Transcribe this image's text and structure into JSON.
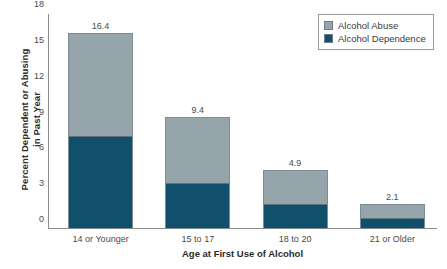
{
  "chart_data": {
    "type": "bar",
    "subtype": "stacked-bar",
    "title": "",
    "xlabel": "Age at First Use of Alcohol",
    "ylabel": "Percent Dependent or Abusing in Past Year",
    "ylabel_line1": "Percent Dependent or Abusing",
    "ylabel_line2": "in Past Year",
    "categories": [
      "14 or Younger",
      "15 to 17",
      "18 to 20",
      "21 or Older"
    ],
    "series": [
      {
        "name": "Alcohol Abuse",
        "color": "#96a4ab",
        "values": [
          8.6,
          5.6,
          2.8,
          1.2
        ]
      },
      {
        "name": "Alcohol Dependence",
        "color": "#11506b",
        "values": [
          7.8,
          3.8,
          2.1,
          0.9
        ]
      }
    ],
    "totals": [
      16.4,
      9.4,
      4.9,
      2.1
    ],
    "total_labels": [
      "16.4",
      "9.4",
      "4.9",
      "2.1"
    ],
    "ylim": [
      0,
      18
    ],
    "yticks": [
      0,
      3,
      6,
      9,
      12,
      15,
      18
    ],
    "ytick_labels": [
      "0",
      "3",
      "6",
      "9",
      "12",
      "15",
      "18"
    ],
    "grid": false,
    "legend_position": "top-right"
  },
  "legend": {
    "items": [
      {
        "label": "Alcohol Abuse",
        "color": "#96a4ab"
      },
      {
        "label": "Alcohol Dependence",
        "color": "#11506b"
      }
    ]
  }
}
